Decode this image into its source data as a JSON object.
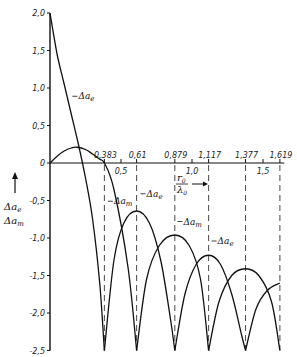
{
  "chart_data": {
    "type": "line",
    "title": "",
    "xlabel": "r0/λ0",
    "ylabel": "Δa_e, Δa_m",
    "xlim": [
      0,
      1.65
    ],
    "ylim": [
      -2.5,
      2.0
    ],
    "grid": false,
    "x_ticks": [
      {
        "value": 0.5,
        "label": "0,5"
      },
      {
        "value": 1.0,
        "label": "1,0"
      },
      {
        "value": 1.5,
        "label": "1,5"
      }
    ],
    "y_ticks": [
      {
        "value": 2.0,
        "label": "2,0"
      },
      {
        "value": 1.5,
        "label": "1,5"
      },
      {
        "value": 1.0,
        "label": "1,0"
      },
      {
        "value": 0.5,
        "label": "0,5"
      },
      {
        "value": 0,
        "label": "0"
      },
      {
        "value": -0.5,
        "label": "-0,5"
      },
      {
        "value": -1.0,
        "label": "-1,0"
      },
      {
        "value": -1.5,
        "label": "-1,5"
      },
      {
        "value": -2.0,
        "label": "-2,0"
      },
      {
        "value": -2.5,
        "label": "-2,5"
      }
    ],
    "dashed_markers": [
      {
        "value": 0.383,
        "label": "0,383"
      },
      {
        "value": 0.61,
        "label": "0,61"
      },
      {
        "value": 0.879,
        "label": "0,879"
      },
      {
        "value": 1.117,
        "label": "1,117"
      },
      {
        "value": 1.377,
        "label": "1,377"
      },
      {
        "value": 1.619,
        "label": "1,619"
      }
    ],
    "series": [
      {
        "name": "Δa_e",
        "lobes": [
          {
            "x": [
              0.0,
              0.05,
              0.1,
              0.15,
              0.2,
              0.25,
              0.3,
              0.35,
              0.383
            ],
            "y": [
              2.0,
              1.45,
              1.05,
              0.65,
              0.25,
              -0.2,
              -0.75,
              -1.6,
              -2.5
            ]
          },
          {
            "x": [
              0.383,
              0.45,
              0.52,
              0.61,
              0.7,
              0.78,
              0.85,
              0.879
            ],
            "y": [
              -2.5,
              -1.3,
              -0.8,
              -0.64,
              -0.8,
              -1.3,
              -2.1,
              -2.5
            ]
          },
          {
            "x": [
              0.879,
              0.95,
              1.03,
              1.117,
              1.2,
              1.28,
              1.35,
              1.377
            ],
            "y": [
              -2.5,
              -1.75,
              -1.35,
              -1.23,
              -1.35,
              -1.75,
              -2.3,
              -2.5
            ]
          },
          {
            "x": [
              1.377,
              1.45,
              1.53,
              1.619
            ],
            "y": [
              -2.5,
              -1.95,
              -1.7,
              -1.6
            ]
          }
        ]
      },
      {
        "name": "Δa_m",
        "lobes": [
          {
            "x": [
              0.0,
              0.05,
              0.1,
              0.15,
              0.19,
              0.25,
              0.3,
              0.35,
              0.383,
              0.45,
              0.55,
              0.61
            ],
            "y": [
              0.0,
              0.09,
              0.16,
              0.2,
              0.21,
              0.18,
              0.12,
              0.05,
              0.0,
              -0.35,
              -1.4,
              -2.5
            ]
          },
          {
            "x": [
              0.61,
              0.68,
              0.77,
              0.879,
              0.98,
              1.06,
              1.117
            ],
            "y": [
              -2.5,
              -1.55,
              -1.1,
              -0.96,
              -1.1,
              -1.55,
              -2.5
            ]
          },
          {
            "x": [
              1.117,
              1.19,
              1.28,
              1.377,
              1.47,
              1.56,
              1.619
            ],
            "y": [
              -2.5,
              -1.85,
              -1.5,
              -1.41,
              -1.5,
              -1.85,
              -2.5
            ]
          }
        ]
      }
    ],
    "annotations": [
      {
        "text": "Δa_e",
        "x": 0.2,
        "y": 0.85
      },
      {
        "text": "Δa_m",
        "x": 0.45,
        "y": -0.55
      },
      {
        "text": "Δa_e",
        "x": 0.68,
        "y": -0.45
      },
      {
        "text": "Δa_m",
        "x": 0.94,
        "y": -0.82
      },
      {
        "text": "Δa_e",
        "x": 1.18,
        "y": -1.08
      },
      {
        "text": "r0/λ0 →",
        "x": 0.94,
        "y": -0.15
      }
    ]
  },
  "labels": {
    "y_axis_line1": "Δa",
    "y_axis_sub1": "e",
    "y_axis_line2": "Δa",
    "y_axis_sub2": "m",
    "x_axis_num": "r",
    "x_axis_num_sub": "0",
    "x_axis_den": "λ",
    "x_axis_den_sub": "0",
    "curve_e": "Δa",
    "curve_e_sub": "e",
    "curve_m": "Δa",
    "curve_m_sub": "m"
  }
}
